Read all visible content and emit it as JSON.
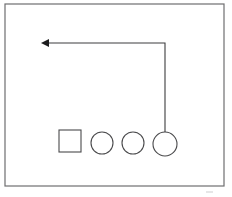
{
  "diagram": {
    "background_color": "#ffffff",
    "frame": {
      "label": "enclosing-border",
      "x": 5,
      "y": 4,
      "width": 219,
      "height": 182,
      "stroke_color": "#6e6e70"
    },
    "shapes": [
      {
        "id": "square-1",
        "kind": "square",
        "label": "square",
        "x": 59,
        "y": 130,
        "width": 22,
        "height": 22,
        "stroke_color": "#4a4a4c",
        "fill_color": "#ffffff"
      },
      {
        "id": "circle-1",
        "kind": "circle",
        "label": "circle",
        "cx": 102,
        "cy": 143,
        "r": 11,
        "stroke_color": "#4a4a4c",
        "fill_color": "#ffffff"
      },
      {
        "id": "circle-2",
        "kind": "circle",
        "label": "circle",
        "cx": 133,
        "cy": 143,
        "r": 11,
        "stroke_color": "#4a4a4c",
        "fill_color": "#ffffff"
      },
      {
        "id": "circle-3",
        "kind": "circle",
        "label": "circle",
        "cx": 165,
        "cy": 144,
        "r": 12,
        "stroke_color": "#4a4a4c",
        "fill_color": "#ffffff"
      }
    ],
    "connector": {
      "id": "arrow-1",
      "label": "elbow-arrow",
      "direction": "left",
      "origin_shape": "circle-3",
      "path": "M 165,132 L 165,43 L 48,43",
      "arrow_tip": {
        "x": 41,
        "y": 43
      },
      "arrow_points": "41,43 49,39 49,47",
      "stroke_color": "#3c3c3e",
      "arrowhead_color": "#1c1c1e"
    },
    "artifact": {
      "id": "faint-mark",
      "label": "faint-scan-mark",
      "x": 206,
      "y": 191,
      "width": 7,
      "height": 3,
      "stroke_color": "#cdcdcf"
    }
  }
}
